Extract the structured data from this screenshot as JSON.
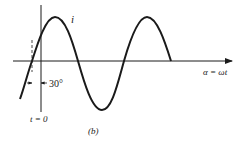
{
  "diagram": {
    "type": "sinusoid-phase-shift",
    "current_label": "i",
    "x_axis_label": "α = ωt",
    "phase_label": "30°",
    "time_zero_label": "t = 0",
    "caption": "(b)",
    "colors": {
      "stroke": "#1a1a1a",
      "background": "#ffffff"
    }
  }
}
